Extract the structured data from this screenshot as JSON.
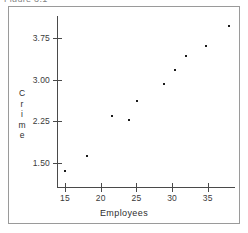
{
  "figure": {
    "caption_clipped": "Figure 3.1"
  },
  "chart_data": {
    "type": "scatter",
    "title": "",
    "xlabel": "Employees",
    "ylabel": "Crime",
    "ylabel_stacked": [
      "C",
      "r",
      "i",
      "m",
      "e"
    ],
    "xlim": [
      13.5,
      39.0
    ],
    "ylim": [
      1.2,
      4.1
    ],
    "xticks": [
      15,
      20,
      25,
      30,
      35
    ],
    "xtick_labels": [
      "15",
      "20",
      "25",
      "30",
      "35"
    ],
    "yticks": [
      1.5,
      2.25,
      3.0,
      3.75
    ],
    "ytick_labels": [
      "1.50",
      "2.25",
      "3.00",
      "3.75"
    ],
    "grid": false,
    "legend": null,
    "marker": "dot",
    "marker_color": "#1a1a1a",
    "points": [
      {
        "x": 15.0,
        "y": 1.36
      },
      {
        "x": 18.1,
        "y": 1.63
      },
      {
        "x": 21.6,
        "y": 2.34
      },
      {
        "x": 23.9,
        "y": 2.28
      },
      {
        "x": 25.1,
        "y": 2.62
      },
      {
        "x": 28.8,
        "y": 2.92
      },
      {
        "x": 30.4,
        "y": 3.17
      },
      {
        "x": 32.0,
        "y": 3.43
      },
      {
        "x": 34.7,
        "y": 3.6
      },
      {
        "x": 37.9,
        "y": 3.96
      }
    ]
  },
  "axis_geometry": {
    "x_px_at_15": 65,
    "x_px_per_unit": 7.14,
    "y_px_at_1_50": 163,
    "y_px_per_unit": 55.6
  }
}
